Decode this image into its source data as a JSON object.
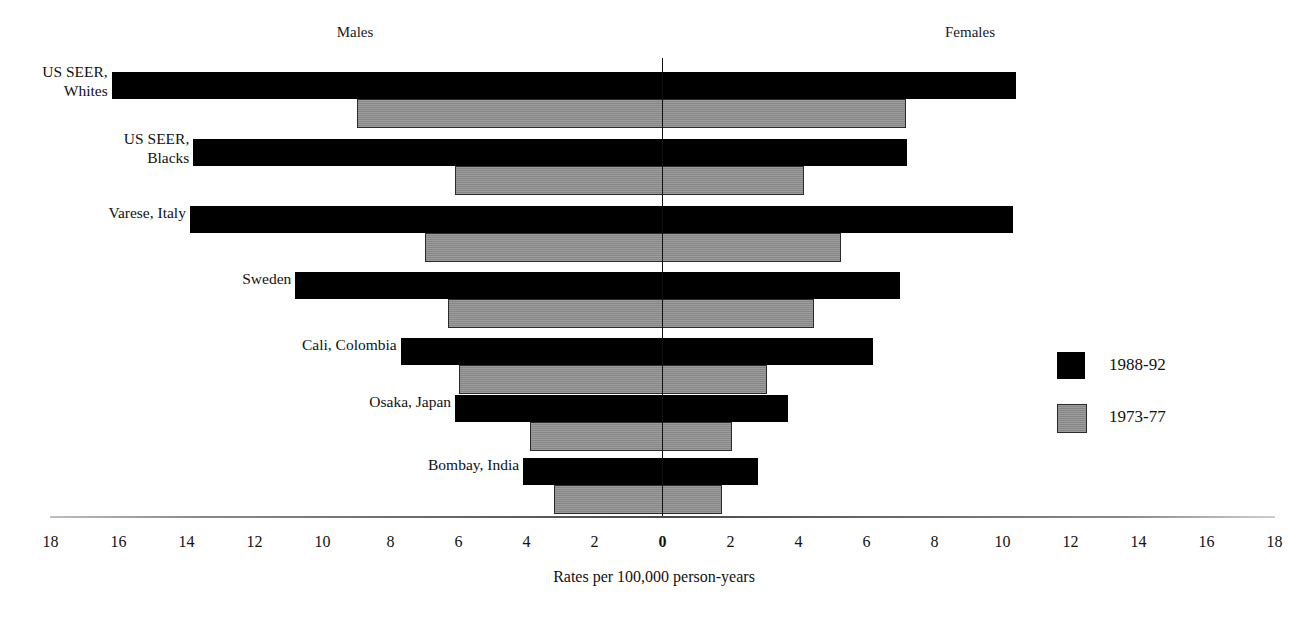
{
  "header": {
    "males_label": "Males",
    "females_label": "Females"
  },
  "legend": {
    "position": "right",
    "entries": [
      {
        "label": "1988-92",
        "color": "#000000",
        "key": "recent"
      },
      {
        "label": "1973-77",
        "color": "#8f8f8f",
        "key": "earlier"
      }
    ]
  },
  "axis": {
    "title": "Rates per 100,000 person-years",
    "ticks": [
      "18",
      "16",
      "14",
      "12",
      "10",
      "8",
      "6",
      "4",
      "2",
      "0",
      "2",
      "4",
      "6",
      "8",
      "10",
      "12",
      "14",
      "16",
      "18"
    ],
    "tick_values": [
      -18,
      -16,
      -14,
      -12,
      -10,
      -8,
      -6,
      -4,
      -2,
      0,
      2,
      4,
      6,
      8,
      10,
      12,
      14,
      16,
      18
    ],
    "zero_index": 9
  },
  "chart_data": {
    "type": "bar",
    "title": "",
    "subtitle": "",
    "xlabel": "Rates per 100,000 person-years",
    "ylabel": "",
    "xlim": [
      -18,
      18
    ],
    "grid": false,
    "legend_position": "right",
    "orientation": "horizontal-bidirectional",
    "left_side": "Males",
    "right_side": "Females",
    "categories": [
      "US SEER, Whites",
      "US SEER, Blacks",
      "Varese, Italy",
      "Sweden",
      "Cali, Colombia",
      "Osaka, Japan",
      "Bombay, India"
    ],
    "category_lines": [
      [
        "US SEER,",
        "Whites"
      ],
      [
        "US SEER,",
        "Blacks"
      ],
      [
        "Varese, Italy"
      ],
      [
        "Sweden"
      ],
      [
        "Cali, Colombia"
      ],
      [
        "Osaka, Japan"
      ],
      [
        "Bombay, India"
      ]
    ],
    "series": [
      {
        "name": "1988-92",
        "color": "#000000",
        "males": [
          16.2,
          13.8,
          13.9,
          10.8,
          7.7,
          6.1,
          4.1
        ],
        "females": [
          10.4,
          7.2,
          10.3,
          7.0,
          6.2,
          3.7,
          2.8
        ]
      },
      {
        "name": "1973-77",
        "color": "#8f8f8f",
        "males": [
          9.0,
          6.1,
          7.0,
          6.3,
          6.0,
          3.9,
          3.2
        ],
        "females": [
          7.1,
          4.1,
          5.2,
          4.4,
          3.0,
          2.0,
          1.7
        ]
      }
    ]
  }
}
